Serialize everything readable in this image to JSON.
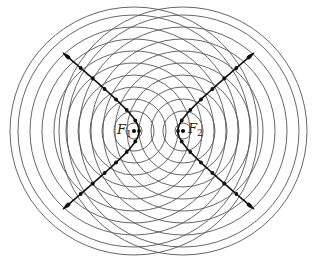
{
  "figure": {
    "width": 316,
    "height": 260,
    "foci": [
      {
        "id": "F1",
        "label": "F",
        "subscript": "1",
        "x": 134,
        "y": 131
      },
      {
        "id": "F2",
        "label": "F",
        "subscript": "2",
        "x": 183,
        "y": 131
      }
    ],
    "circle_radii": [
      8,
      20,
      32,
      44,
      56,
      68,
      80,
      92,
      104,
      116,
      124
    ],
    "hyperbola": {
      "center_x": 158.5,
      "center_y": 131,
      "a": 19.5,
      "b": 16.3,
      "y_extent": 78,
      "arrow_endpoints": [
        {
          "x": 63,
          "y": 53
        },
        {
          "x": 63,
          "y": 211
        },
        {
          "x": 256,
          "y": 53
        },
        {
          "x": 256,
          "y": 211
        }
      ]
    },
    "colors": {
      "circle_stroke": "#555555",
      "hyperbola_stroke": "#111111",
      "background": "#ffffff"
    }
  },
  "labels": {
    "f1": {
      "main": "F",
      "sub": "1"
    },
    "f2": {
      "main": "F",
      "sub": "2"
    }
  }
}
